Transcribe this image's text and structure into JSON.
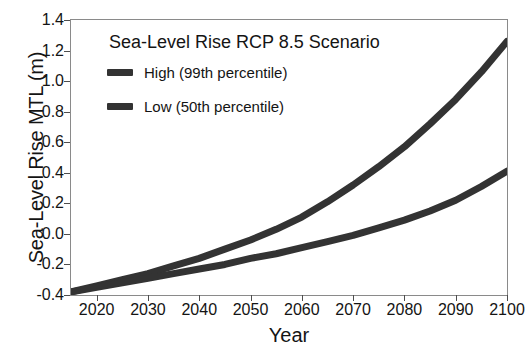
{
  "chart_data": {
    "type": "line",
    "title": "Sea-Level Rise RCP 8.5 Scenario",
    "xlabel": "Year",
    "ylabel": "Sea-Level Rise MTL (m)",
    "xlim": [
      2015,
      2100
    ],
    "ylim": [
      -0.4,
      1.4
    ],
    "xticks": [
      "2020",
      "2030",
      "2040",
      "2050",
      "2060",
      "2070",
      "2080",
      "2090",
      "2100"
    ],
    "xtick_values": [
      2020,
      2030,
      2040,
      2050,
      2060,
      2070,
      2080,
      2090,
      2100
    ],
    "yticks": [
      "1.4",
      "1.2",
      "1.0",
      "0.8",
      "0.6",
      "0.4",
      "0.2",
      "0.0",
      "-0.2",
      "-0.4"
    ],
    "ytick_values": [
      1.4,
      1.2,
      1.0,
      0.8,
      0.6,
      0.4,
      0.2,
      0.0,
      -0.2,
      -0.4
    ],
    "grid": false,
    "legend_position": "upper-left-inside",
    "line_width_px": 7,
    "x": [
      2015,
      2020,
      2025,
      2030,
      2035,
      2040,
      2045,
      2050,
      2055,
      2060,
      2065,
      2070,
      2075,
      2080,
      2085,
      2090,
      2095,
      2100
    ],
    "series": [
      {
        "name": "High (99th percentile)",
        "color": "#333333",
        "values": [
          -0.38,
          -0.34,
          -0.3,
          -0.26,
          -0.21,
          -0.16,
          -0.1,
          -0.04,
          0.03,
          0.11,
          0.21,
          0.32,
          0.44,
          0.57,
          0.72,
          0.88,
          1.06,
          1.26
        ]
      },
      {
        "name": "Low (50th percentile)",
        "color": "#333333",
        "values": [
          -0.38,
          -0.35,
          -0.32,
          -0.29,
          -0.26,
          -0.23,
          -0.2,
          -0.16,
          -0.13,
          -0.09,
          -0.05,
          -0.01,
          0.04,
          0.09,
          0.15,
          0.22,
          0.31,
          0.41
        ]
      }
    ]
  },
  "legend": {
    "items": [
      {
        "label": "High (99th percentile)",
        "color": "#333333"
      },
      {
        "label": "Low (50th percentile)",
        "color": "#333333"
      }
    ]
  },
  "style": {
    "frame_color": "#8a8a8a",
    "text_color": "#141414",
    "background": "#ffffff",
    "line_color": "#333333"
  }
}
